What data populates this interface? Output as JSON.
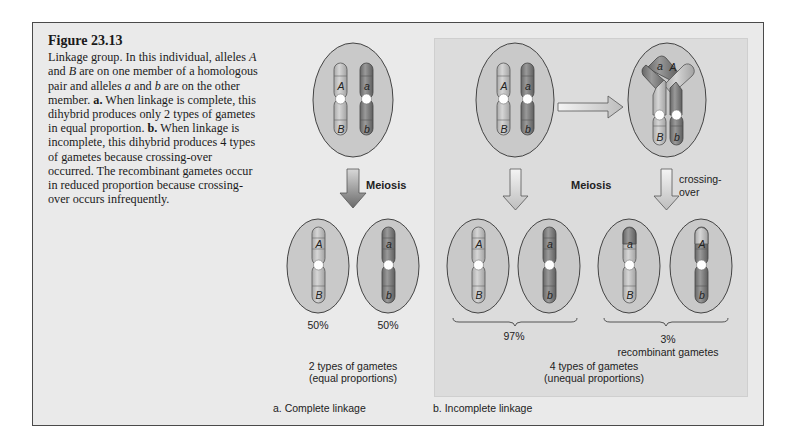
{
  "figure": {
    "title": "Figure 23.13",
    "caption_parts": [
      "Linkage group. In this individual, alleles ",
      "A",
      " and ",
      "B",
      " are on one member of a homologous pair and alleles ",
      "a",
      " and ",
      "b",
      " are on the other member. ",
      "a.",
      " When linkage is complete, this dihybrid produces only 2 types of gametes in equal proportion. ",
      "b.",
      " When linkage is incomplete, this dihybrid produces 4 types of gametes because crossing-over occurred. The recombinant gametes occur in reduced proportion because crossing-over occurs infrequently."
    ]
  },
  "colors": {
    "frame_bg": "#eaeaea",
    "panel_b_bg": "#dcdcdc",
    "cell_fill": "#c9c9c9",
    "light_chromosome": "#c2c2c2",
    "dark_chromosome": "#8a8a8a",
    "centromere": "#ffffff",
    "outline": "#444444"
  },
  "panel_a": {
    "meiosis_label": "Meiosis",
    "percent_left": "50%",
    "percent_right": "50%",
    "summary_line1": "2 types of gametes",
    "summary_line2": "(equal proportions)",
    "panel_label": "a. Complete linkage",
    "parent_alleles": {
      "left_top": "A",
      "left_bottom": "B",
      "right_top": "a",
      "right_bottom": "b"
    },
    "gametes": [
      {
        "top": "A",
        "bottom": "B",
        "shade": "light"
      },
      {
        "top": "a",
        "bottom": "b",
        "shade": "dark"
      }
    ]
  },
  "panel_b": {
    "meiosis_label": "Meiosis",
    "crossing_over_line1": "crossing-",
    "crossing_over_line2": "over",
    "parental_percent": "97%",
    "recombinant_percent": "3%",
    "recombinant_label": "recombinant gametes",
    "summary_line1": "4 types of gametes",
    "summary_line2": "(unequal proportions)",
    "panel_label": "b. Incomplete linkage",
    "parent_alleles": {
      "left_top": "A",
      "left_bottom": "B",
      "right_top": "a",
      "right_bottom": "b"
    },
    "crossover_alleles": {
      "left_top": "a",
      "right_top": "A",
      "left_bottom": "B",
      "right_bottom": "b"
    },
    "gametes": [
      {
        "top": "A",
        "bottom": "B",
        "shade": "light",
        "type": "parental"
      },
      {
        "top": "a",
        "bottom": "b",
        "shade": "dark",
        "type": "parental"
      },
      {
        "top": "a",
        "bottom": "B",
        "shade": "mixed-dark-top",
        "type": "recombinant"
      },
      {
        "top": "A",
        "bottom": "b",
        "shade": "mixed-light-top",
        "type": "recombinant"
      }
    ]
  }
}
